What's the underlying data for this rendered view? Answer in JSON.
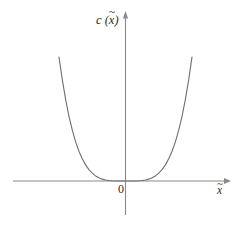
{
  "figure": {
    "background_color": "#ffffff",
    "width": 246,
    "height": 226
  },
  "labels": {
    "y_axis": {
      "function_name": "c",
      "open_paren": " (",
      "variable": "x",
      "tilde": "~",
      "close_paren": ")"
    },
    "x_axis": {
      "variable": "x",
      "tilde": "~"
    },
    "origin": "0"
  },
  "style": {
    "axis_color": "#8a8a8a",
    "curve_color": "#6e6e6e",
    "text_color": "#2b2b2b",
    "axis_width": 1.1,
    "curve_width": 1.1
  },
  "chart_data": {
    "type": "line",
    "title": "",
    "xlabel": "x̃",
    "ylabel": "c (x̃)",
    "grid": false,
    "legend": null,
    "axes": {
      "origin_px": [
        125.5,
        181.0
      ],
      "x_axis_px": {
        "x_start": 13,
        "x_end": 231,
        "y": 181,
        "arrow": "right"
      },
      "y_axis_px": {
        "y_start": 12,
        "y_end": 215,
        "x": 125.5,
        "arrow": "up"
      }
    },
    "xlim": [
      -1.05,
      1.05
    ],
    "ylim": [
      0,
      1.05
    ],
    "x": [
      -1.0,
      -0.95,
      -0.9,
      -0.85,
      -0.8,
      -0.75,
      -0.7,
      -0.65,
      -0.6,
      -0.55,
      -0.5,
      -0.45,
      -0.4,
      -0.35,
      -0.3,
      -0.25,
      -0.2,
      -0.15,
      -0.1,
      -0.05,
      0.0,
      0.05,
      0.1,
      0.15,
      0.2,
      0.25,
      0.3,
      0.35,
      0.4,
      0.45,
      0.5,
      0.55,
      0.6,
      0.65,
      0.7,
      0.75,
      0.8,
      0.85,
      0.9,
      0.95,
      1.0
    ],
    "values": [
      1.0,
      0.815,
      0.656,
      0.522,
      0.41,
      0.316,
      0.24,
      0.179,
      0.13,
      0.092,
      0.063,
      0.041,
      0.026,
      0.015,
      0.0081,
      0.0039,
      0.0016,
      0.00051,
      0.0001,
      6.3e-06,
      0.0,
      6.3e-06,
      0.0001,
      0.00051,
      0.0016,
      0.0039,
      0.0081,
      0.015,
      0.026,
      0.041,
      0.063,
      0.092,
      0.13,
      0.179,
      0.24,
      0.316,
      0.41,
      0.522,
      0.656,
      0.815,
      1.0
    ],
    "series": [
      {
        "name": "c(x̃)",
        "relation": "c(x̃) = |x̃|^4",
        "color": "#6e6e6e"
      }
    ],
    "key_points": [
      {
        "label": "minimum",
        "x": 0.0,
        "y": 0.0
      },
      {
        "label": "left branch top",
        "x": -1.0,
        "y": 1.0
      },
      {
        "label": "right branch top",
        "x": 1.0,
        "y": 1.0
      }
    ]
  }
}
